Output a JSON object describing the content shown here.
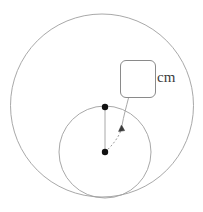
{
  "diagram": {
    "background_color": "#ffffff",
    "stroke_color": "#9a9a9a",
    "point_color": "#1a1a1a",
    "leader_color": "#8e8e8e",
    "large_circle": {
      "name": "outer-circle",
      "cx": 102,
      "cy": 105.5,
      "r": 91.5
    },
    "small_circle": {
      "name": "inner-circle",
      "cx": 105,
      "cy": 152,
      "r": 46
    },
    "points": [
      {
        "name": "upper-point",
        "cx": 105,
        "cy": 107,
        "r": 3.2
      },
      {
        "name": "lower-point",
        "cx": 105,
        "cy": 152,
        "r": 3.2
      }
    ],
    "radius_segment": {
      "name": "radius-line",
      "x1": 105,
      "y1": 107,
      "x2": 105,
      "y2": 152
    },
    "measure_arc": {
      "name": "measure-arc",
      "path": "M 105 152 C 112 146 120 136 122 127",
      "dash": "2 2"
    },
    "arrow_head": {
      "name": "arc-arrowhead",
      "tip_x": 121.5,
      "tip_y": 125.5
    },
    "leader_line": {
      "name": "leader-line",
      "path": "M 128 98 C 126 106 123 116 122 125"
    }
  },
  "answer_field": {
    "name": "answer-input",
    "value": "",
    "placeholder": ""
  },
  "unit": {
    "label": "cm"
  }
}
